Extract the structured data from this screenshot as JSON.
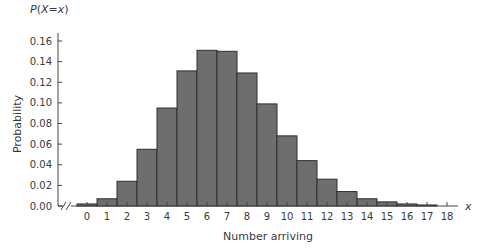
{
  "chart_data": {
    "type": "bar",
    "title": "",
    "xlabel": "Number arriving",
    "ylabel": "Probability",
    "y_axis_top_label": "P(X=x)",
    "x_axis_end_label": "x",
    "categories": [
      "0",
      "1",
      "2",
      "3",
      "4",
      "5",
      "6",
      "7",
      "8",
      "9",
      "10",
      "11",
      "12",
      "13",
      "14",
      "15",
      "16",
      "17",
      "18"
    ],
    "values": [
      0.002,
      0.007,
      0.024,
      0.055,
      0.095,
      0.131,
      0.151,
      0.15,
      0.129,
      0.099,
      0.068,
      0.044,
      0.026,
      0.014,
      0.007,
      0.004,
      0.002,
      0.001,
      0.0
    ],
    "ylim": [
      0,
      0.16
    ],
    "yticks": [
      "0.00",
      "0.02",
      "0.04",
      "0.06",
      "0.08",
      "0.10",
      "0.12",
      "0.14",
      "0.16"
    ],
    "xticks": [
      "0",
      "1",
      "2",
      "3",
      "4",
      "5",
      "6",
      "7",
      "8",
      "9",
      "10",
      "11",
      "12",
      "13",
      "14",
      "15",
      "16",
      "17",
      "18"
    ],
    "grid": false,
    "axis_break": true,
    "bar_color": "#6e6e6e",
    "bar_edge_color": "#2e2e2e"
  }
}
